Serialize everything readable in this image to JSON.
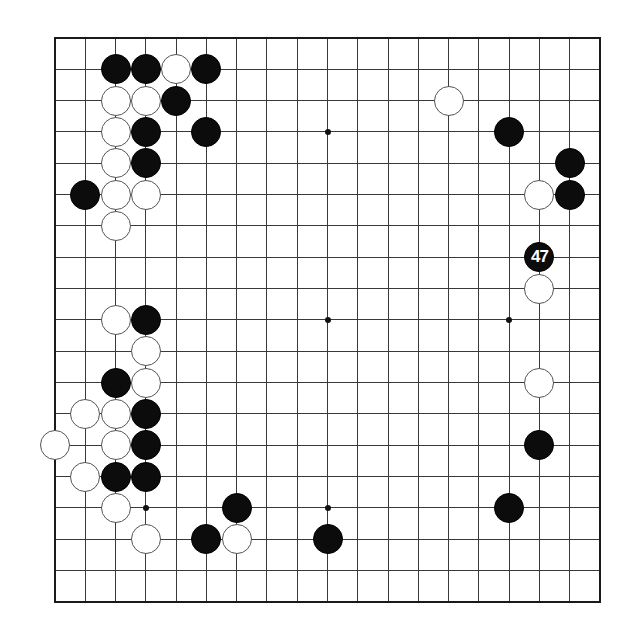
{
  "board": {
    "size": 19,
    "origin_x": 55,
    "origin_y": 38,
    "spacing_x": 30.28,
    "spacing_y": 31.33,
    "line_color": "#3a3a3a",
    "border_color": "#1a1a1a",
    "star_points": [
      [
        3,
        3
      ],
      [
        9,
        3
      ],
      [
        15,
        3
      ],
      [
        3,
        9
      ],
      [
        9,
        9
      ],
      [
        15,
        9
      ],
      [
        3,
        15
      ],
      [
        9,
        15
      ],
      [
        15,
        15
      ]
    ]
  },
  "stones": {
    "black": [
      {
        "col": 2,
        "row": 1
      },
      {
        "col": 3,
        "row": 1
      },
      {
        "col": 5,
        "row": 1
      },
      {
        "col": 4,
        "row": 2
      },
      {
        "col": 3,
        "row": 3
      },
      {
        "col": 5,
        "row": 3
      },
      {
        "col": 3,
        "row": 4
      },
      {
        "col": 1,
        "row": 5
      },
      {
        "col": 3,
        "row": 9
      },
      {
        "col": 2,
        "row": 11
      },
      {
        "col": 3,
        "row": 12
      },
      {
        "col": 3,
        "row": 13
      },
      {
        "col": 2,
        "row": 14
      },
      {
        "col": 3,
        "row": 14
      },
      {
        "col": 6,
        "row": 15
      },
      {
        "col": 5,
        "row": 16
      },
      {
        "col": 9,
        "row": 16
      },
      {
        "col": 15,
        "row": 3
      },
      {
        "col": 17,
        "row": 4
      },
      {
        "col": 17,
        "row": 5
      },
      {
        "col": 16,
        "row": 7,
        "label": "47"
      },
      {
        "col": 16,
        "row": 13
      },
      {
        "col": 15,
        "row": 15
      }
    ],
    "white": [
      {
        "col": 4,
        "row": 1
      },
      {
        "col": 2,
        "row": 2
      },
      {
        "col": 3,
        "row": 2
      },
      {
        "col": 2,
        "row": 3
      },
      {
        "col": 2,
        "row": 4
      },
      {
        "col": 2,
        "row": 5
      },
      {
        "col": 3,
        "row": 5
      },
      {
        "col": 2,
        "row": 6
      },
      {
        "col": 2,
        "row": 9
      },
      {
        "col": 3,
        "row": 10
      },
      {
        "col": 3,
        "row": 11
      },
      {
        "col": 1,
        "row": 12
      },
      {
        "col": 2,
        "row": 12
      },
      {
        "col": 0,
        "row": 13
      },
      {
        "col": 2,
        "row": 13
      },
      {
        "col": 1,
        "row": 14
      },
      {
        "col": 2,
        "row": 15
      },
      {
        "col": 3,
        "row": 16
      },
      {
        "col": 6,
        "row": 16
      },
      {
        "col": 13,
        "row": 2
      },
      {
        "col": 16,
        "row": 5
      },
      {
        "col": 16,
        "row": 8
      },
      {
        "col": 16,
        "row": 11
      }
    ]
  },
  "move_label": "47"
}
